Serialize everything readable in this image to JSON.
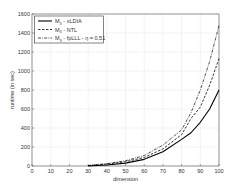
{
  "chart_data": {
    "type": "line",
    "title": "",
    "xlabel": "dimension",
    "ylabel": "runtime (in sec)",
    "xlim": [
      0,
      100
    ],
    "ylim": [
      0,
      1600
    ],
    "xticks": [
      "0",
      "10",
      "20",
      "30",
      "40",
      "50",
      "60",
      "70",
      "80",
      "90",
      "100"
    ],
    "yticks": [
      "0",
      "200",
      "400",
      "600",
      "800",
      "1000",
      "1200",
      "1400",
      "1600"
    ],
    "grid": true,
    "legend_position": "top-left",
    "x": [
      30,
      40,
      50,
      60,
      70,
      80,
      85,
      90,
      95,
      100
    ],
    "series": [
      {
        "name": "M3 - xLDIA",
        "style": "solid",
        "color": "#000000",
        "values": [
          0,
          10,
          30,
          70,
          150,
          280,
          350,
          460,
          600,
          800
        ]
      },
      {
        "name": "M3 - NTL",
        "style": "dashed",
        "color": "#000000",
        "values": [
          5,
          20,
          45,
          90,
          180,
          330,
          500,
          620,
          850,
          1130
        ]
      },
      {
        "name": "M3 - fpLLL - η = 0.51",
        "style": "dashdot",
        "color": "#000000",
        "values": [
          5,
          25,
          55,
          110,
          220,
          380,
          560,
          800,
          1100,
          1480
        ]
      }
    ]
  },
  "legend": [
    {
      "main": "M",
      "sub": "3",
      "rest": " - xLDIA"
    },
    {
      "main": "M",
      "sub": "3",
      "rest": " - NTL"
    },
    {
      "main": "M",
      "sub": "3",
      "rest": " - fpLLL - η = 0.51"
    }
  ]
}
